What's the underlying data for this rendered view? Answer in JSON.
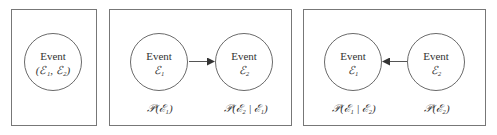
{
  "panels": [
    {
      "id": "joint",
      "nodes": [
        {
          "title": "Event",
          "symbol": "(ℰ₁, ℰ₂)"
        }
      ]
    },
    {
      "id": "e1-to-e2",
      "nodes": [
        {
          "title": "Event",
          "symbol": "ℰ₁",
          "probability": "𝒫(ℰ₁)"
        },
        {
          "title": "Event",
          "symbol": "ℰ₂",
          "probability": "𝒫(ℰ₂ | ℰ₁)"
        }
      ],
      "edge": {
        "from": "ℰ₁",
        "to": "ℰ₂",
        "direction": "right"
      }
    },
    {
      "id": "e2-to-e1",
      "nodes": [
        {
          "title": "Event",
          "symbol": "ℰ₁",
          "probability": "𝒫(ℰ₁ | ℰ₂)"
        },
        {
          "title": "Event",
          "symbol": "ℰ₂",
          "probability": "𝒫(ℰ₂)"
        }
      ],
      "edge": {
        "from": "ℰ₂",
        "to": "ℰ₁",
        "direction": "left"
      }
    }
  ],
  "colors": {
    "border": "#777777",
    "circle": "#6a6a6a",
    "text": "#333333",
    "arrow": "#444444"
  }
}
